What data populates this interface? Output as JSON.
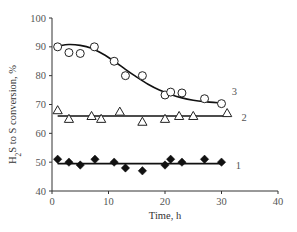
{
  "chart_data": {
    "type": "scatter",
    "title": "",
    "xlabel": "Time, h",
    "ylabel": "H2S to S conversion, %",
    "ylabel_parts": {
      "pre": "H",
      "sub": "2",
      "post": "S to S conversion, %"
    },
    "xlim": [
      0,
      40
    ],
    "ylim": [
      40,
      100
    ],
    "xticks": [
      0,
      10,
      20,
      30,
      40
    ],
    "yticks": [
      40,
      50,
      60,
      70,
      80,
      90,
      100
    ],
    "grid": false,
    "legend": "inline series numbers at right end of each curve",
    "series": [
      {
        "name": "1",
        "marker": "filled-diamond",
        "x": [
          1,
          3,
          5,
          7.6,
          11,
          13,
          16,
          20,
          21,
          23,
          27,
          30
        ],
        "y": [
          51,
          50,
          49,
          51,
          50,
          48,
          47,
          49,
          51,
          50,
          51,
          50
        ],
        "fit": {
          "type": "horizontal",
          "x": [
            1,
            30
          ],
          "y": [
            49.5,
            49.5
          ]
        }
      },
      {
        "name": "2",
        "marker": "open-triangle",
        "x": [
          1,
          3,
          7,
          8.7,
          12,
          16,
          20,
          22.5,
          25,
          31
        ],
        "y": [
          68,
          65,
          66,
          65,
          67.5,
          64,
          65,
          66,
          66,
          67
        ],
        "fit": {
          "type": "horizontal",
          "x": [
            1,
            31
          ],
          "y": [
            66,
            66
          ]
        }
      },
      {
        "name": "3",
        "marker": "open-circle",
        "x": [
          1,
          3,
          5,
          7.5,
          11,
          13,
          16,
          20,
          21,
          23,
          27,
          30
        ],
        "y": [
          90,
          88,
          87.7,
          90,
          85,
          80,
          80,
          73.3,
          74.3,
          74,
          72,
          70.3
        ],
        "fit": {
          "type": "sigmoid-curve",
          "x": [
            1,
            3,
            5,
            7,
            9,
            11,
            13,
            15,
            17,
            19,
            21,
            23,
            25,
            27,
            30
          ],
          "y": [
            90.3,
            90.8,
            90.5,
            89.5,
            87.5,
            85,
            82.2,
            79.5,
            77,
            75,
            73.5,
            72.3,
            71.5,
            71,
            70.5
          ]
        }
      }
    ],
    "labels": [
      {
        "text": "1",
        "x": 33,
        "y": 49
      },
      {
        "text": "2",
        "x": 34,
        "y": 65.5
      },
      {
        "text": "3",
        "x": 32.3,
        "y": 74.5
      }
    ]
  }
}
